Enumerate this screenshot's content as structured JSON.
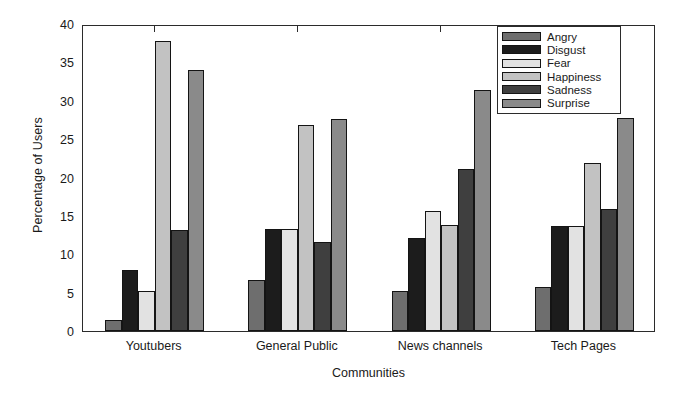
{
  "chart_data": {
    "type": "bar",
    "title": "",
    "xlabel": "Communities",
    "ylabel": "Percentage of Users",
    "categories": [
      "Youtubers",
      "General Public",
      "News channels",
      "Tech Pages"
    ],
    "series": [
      {
        "name": "Angry",
        "color": "#6e6e6e",
        "values": [
          1.5,
          6.6,
          5.2,
          5.8
        ]
      },
      {
        "name": "Disgust",
        "color": "#1c1c1c",
        "values": [
          8.0,
          13.3,
          12.1,
          13.7
        ]
      },
      {
        "name": "Fear",
        "color": "#e2e2e2",
        "values": [
          5.2,
          13.3,
          15.6,
          13.7
        ]
      },
      {
        "name": "Happiness",
        "color": "#c2c2c2",
        "values": [
          37.8,
          26.9,
          13.8,
          21.9
        ]
      },
      {
        "name": "Sadness",
        "color": "#3f3f3f",
        "values": [
          13.2,
          11.6,
          21.1,
          15.9
        ]
      },
      {
        "name": "Surprise",
        "color": "#8a8a8a",
        "values": [
          34.0,
          27.6,
          31.4,
          27.7
        ]
      }
    ],
    "ylim": [
      0,
      40
    ],
    "yticks": [
      0,
      5,
      10,
      15,
      20,
      25,
      30,
      35,
      40
    ],
    "ytick_labels": [
      "0",
      "5",
      "10",
      "15",
      "20",
      "25",
      "30",
      "35",
      "40"
    ],
    "grid": false,
    "legend_position": "top-right",
    "legend_entries": [
      "Angry",
      "Disgust",
      "Fear",
      "Happiness",
      "Sadness",
      "Surprise"
    ]
  }
}
